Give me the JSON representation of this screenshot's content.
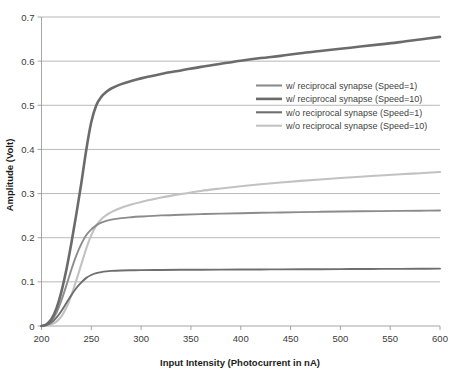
{
  "chart_data": {
    "type": "line",
    "title": "",
    "xlabel": "Input Intensity (Photocurrent in nA)",
    "ylabel": "Amplitude (Volt)",
    "xlim": [
      200,
      600
    ],
    "ylim": [
      0,
      0.7
    ],
    "xticks": [
      200,
      250,
      300,
      350,
      400,
      450,
      500,
      550,
      600
    ],
    "yticks": [
      0,
      0.1,
      0.2,
      0.3,
      0.4,
      0.5,
      0.6,
      0.7
    ],
    "xtick_labels": [
      "200",
      "250",
      "300",
      "350",
      "400",
      "450",
      "500",
      "550",
      "600"
    ],
    "ytick_labels": [
      "0",
      "0.1",
      "0.2",
      "0.3",
      "0.4",
      "0.5",
      "0.6",
      "0.7"
    ],
    "grid": "horizontal",
    "legend_position": "upper-right-inside",
    "x": [
      200,
      205,
      210,
      215,
      220,
      225,
      230,
      235,
      240,
      245,
      250,
      255,
      260,
      265,
      270,
      280,
      290,
      300,
      320,
      340,
      360,
      380,
      400,
      420,
      440,
      460,
      480,
      500,
      520,
      540,
      560,
      580,
      600
    ],
    "series": [
      {
        "name": "w/ reciprocal synapse (Speed=1)",
        "color": "#8c8c8c",
        "width": 1.9,
        "values": [
          0.0,
          0.003,
          0.012,
          0.03,
          0.058,
          0.092,
          0.128,
          0.16,
          0.186,
          0.206,
          0.219,
          0.228,
          0.234,
          0.238,
          0.241,
          0.2445,
          0.2465,
          0.248,
          0.2505,
          0.252,
          0.2535,
          0.2545,
          0.2555,
          0.2565,
          0.2572,
          0.258,
          0.2587,
          0.2593,
          0.2598,
          0.2603,
          0.2608,
          0.2612,
          0.2615
        ]
      },
      {
        "name": "w/ reciprocal synapse (Speed=10)",
        "color": "#6b6b6b",
        "width": 2.6,
        "values": [
          0.0,
          0.004,
          0.016,
          0.04,
          0.078,
          0.128,
          0.188,
          0.254,
          0.324,
          0.4,
          0.462,
          0.5,
          0.519,
          0.53,
          0.538,
          0.548,
          0.555,
          0.561,
          0.571,
          0.579,
          0.587,
          0.594,
          0.601,
          0.607,
          0.612,
          0.618,
          0.623,
          0.628,
          0.633,
          0.638,
          0.643,
          0.649,
          0.655
        ]
      },
      {
        "name": "w/o reciprocal synapse (Speed=1)",
        "color": "#6f6f6f",
        "width": 1.9,
        "values": [
          0.0,
          0.002,
          0.008,
          0.019,
          0.034,
          0.052,
          0.07,
          0.086,
          0.099,
          0.109,
          0.1155,
          0.1196,
          0.1222,
          0.1238,
          0.1248,
          0.1258,
          0.1263,
          0.1266,
          0.127,
          0.1273,
          0.1275,
          0.1277,
          0.1279,
          0.1281,
          0.1283,
          0.1285,
          0.1287,
          0.1289,
          0.1291,
          0.1293,
          0.1295,
          0.1297,
          0.1299
        ]
      },
      {
        "name": "w/o reciprocal synapse (Speed=10)",
        "color": "#c2c2c2",
        "width": 2.1,
        "values": [
          0.0,
          0.001,
          0.004,
          0.01,
          0.022,
          0.042,
          0.07,
          0.104,
          0.14,
          0.176,
          0.206,
          0.228,
          0.242,
          0.251,
          0.258,
          0.268,
          0.275,
          0.281,
          0.291,
          0.299,
          0.306,
          0.3115,
          0.3165,
          0.321,
          0.325,
          0.3287,
          0.332,
          0.3352,
          0.3382,
          0.341,
          0.3437,
          0.3462,
          0.3487
        ]
      }
    ]
  },
  "legend": {
    "entries": [
      {
        "label": "w/ reciprocal synapse (Speed=1)"
      },
      {
        "label": "w/ reciprocal synapse (Speed=10)"
      },
      {
        "label": "w/o reciprocal synapse (Speed=1)"
      },
      {
        "label": "w/o reciprocal synapse (Speed=10)"
      }
    ]
  }
}
